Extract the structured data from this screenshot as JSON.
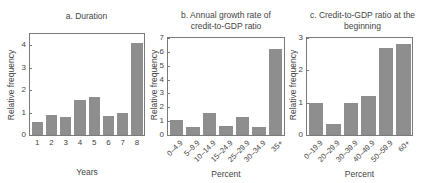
{
  "chart_data": [
    {
      "type": "bar",
      "title": "a. Duration",
      "xlabel": "Years",
      "ylabel": "Relative frequency",
      "categories": [
        "1",
        "2",
        "3",
        "4",
        "5",
        "6",
        "7",
        "8"
      ],
      "values": [
        0.6,
        0.9,
        0.8,
        1.55,
        1.7,
        0.85,
        1.0,
        4.1
      ],
      "ylim": [
        0,
        4.5
      ],
      "yticks": [
        0,
        1,
        2,
        3,
        4
      ],
      "grid": false,
      "color": "#8e8e8e"
    },
    {
      "type": "bar",
      "title": "b. Annual growth rate of credit-to-GDP ratio",
      "title_lines": [
        "b. Annual growth rate of",
        "credit-to-GDP ratio"
      ],
      "xlabel": "Percent",
      "ylabel": "Relative frequency",
      "categories": [
        "0–4.9",
        "5–9.9",
        "10–14.9",
        "15–24.9",
        "25–29.9",
        "30–34.9",
        "35+"
      ],
      "values": [
        1.05,
        0.6,
        1.6,
        0.65,
        1.3,
        0.6,
        6.2
      ],
      "ylim": [
        0,
        7
      ],
      "yticks": [
        0,
        1,
        2,
        3,
        4,
        5,
        6,
        7
      ],
      "grid": false,
      "color": "#8e8e8e"
    },
    {
      "type": "bar",
      "title": "c. Credit-to-GDP ratio at the beginning",
      "title_lines": [
        "c. Credit-to-GDP ratio at the",
        "beginning"
      ],
      "xlabel": "Percent",
      "ylabel": "Relative frequency",
      "categories": [
        "0–19.9",
        "20–29.9",
        "30–39.9",
        "40–49.9",
        "50–59.9",
        "60+"
      ],
      "values": [
        1.0,
        0.33,
        1.0,
        1.2,
        2.7,
        2.8
      ],
      "ylim": [
        0,
        3
      ],
      "yticks": [
        0,
        1,
        2,
        3
      ],
      "grid": false,
      "color": "#8e8e8e"
    }
  ]
}
